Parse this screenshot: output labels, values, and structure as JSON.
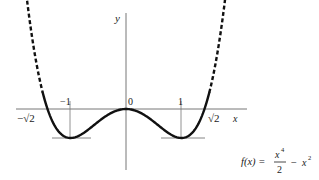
{
  "chart_data": {
    "type": "line",
    "title": "",
    "function_label": "f(x) = x^4/2 - x^2",
    "formula": {
      "lhs": "f(x) =",
      "numerator": "x",
      "numerator_exp": "4",
      "denominator": "2",
      "minus": "−",
      "term": "x",
      "term_exp": "2"
    },
    "xlabel": "x",
    "ylabel": "y",
    "x_ticks": [
      {
        "value": -1.41421,
        "label": "−√2"
      },
      {
        "value": -1,
        "label": "−1"
      },
      {
        "value": 0,
        "label": "0"
      },
      {
        "value": 1,
        "label": "1"
      },
      {
        "value": 1.41421,
        "label": "√2"
      }
    ],
    "key_points": [
      {
        "x": -1.41421,
        "y": 0,
        "note": "root"
      },
      {
        "x": -1,
        "y": -0.5,
        "note": "local minimum"
      },
      {
        "x": 0,
        "y": 0,
        "note": "local maximum"
      },
      {
        "x": 1,
        "y": -0.5,
        "note": "local minimum"
      },
      {
        "x": 1.41421,
        "y": 0,
        "note": "root"
      }
    ],
    "series": [
      {
        "name": "f(x) solid",
        "x_range": [
          -1.5,
          1.5
        ],
        "style": "solid"
      },
      {
        "name": "f(x) dashed extension",
        "x_range": [
          -1.95,
          -1.5
        ],
        "style": "dashed"
      },
      {
        "name": "f(x) dashed extension",
        "x_range": [
          1.5,
          1.95
        ],
        "style": "dashed"
      }
    ],
    "annotations": [
      "horizontal tangent lines at minima y = -0.5",
      "vertical guide lines at x = -1 and x = 1"
    ],
    "grid": false,
    "legend": "none"
  },
  "colors": {
    "curve": "#111111",
    "axis": "#666666",
    "background": "#ffffff"
  }
}
